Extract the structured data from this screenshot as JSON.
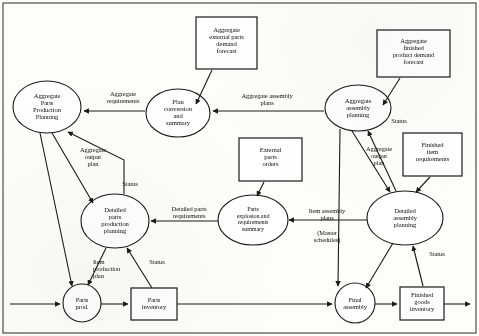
{
  "diagram": {
    "stroke_color": "#1a1a1a",
    "fill_color": "#ffffff",
    "background_color": "#fdfdfb",
    "nodes": [
      {
        "id": "agg_external_parts_forecast",
        "shape": "box",
        "label": "Aggregate\nexternal parts\ndemand\nforecast",
        "lines": [
          "Aggregate",
          "external parts",
          "demand",
          "forecast"
        ],
        "x": 196,
        "y": 17,
        "w": 61,
        "h": 52
      },
      {
        "id": "agg_finished_product_forecast",
        "shape": "box",
        "label": "Aggregate\nfinished\nproduct demand\nforecast",
        "lines": [
          "Aggregate",
          "finished",
          "product demand",
          "forecast"
        ],
        "x": 377,
        "y": 30,
        "w": 73,
        "h": 47
      },
      {
        "id": "agg_parts_production_planning",
        "shape": "ellipse",
        "label": "Aggregate\nParts\nProduction\nPlanning",
        "lines": [
          "Aggregate",
          "Parts",
          "Production",
          "Planning"
        ],
        "cx": 47,
        "cy": 107,
        "rx": 34,
        "ry": 26
      },
      {
        "id": "plan_conversion_and_summary",
        "shape": "ellipse",
        "label": "Plan\nconversion\nand\nsummary",
        "lines": [
          "Plan",
          "conversion",
          "and",
          "summary"
        ],
        "cx": 178,
        "cy": 113,
        "rx": 32,
        "ry": 24
      },
      {
        "id": "agg_assembly_planning",
        "shape": "ellipse",
        "label": "Aggregate\nassembly\nplanning",
        "lines": [
          "Aggregate",
          "assembly",
          "planning"
        ],
        "cx": 358,
        "cy": 108,
        "rx": 33,
        "ry": 23
      },
      {
        "id": "external_parts_orders",
        "shape": "box",
        "label": "External\nparts\norders",
        "lines": [
          "External",
          "parts",
          "orders"
        ],
        "x": 239,
        "y": 138,
        "w": 63,
        "h": 43
      },
      {
        "id": "finished_item_requirements",
        "shape": "box",
        "label": "Finished\nitem\nrequirements",
        "lines": [
          "Finished",
          "item",
          "requirements"
        ],
        "x": 403,
        "y": 133,
        "w": 59,
        "h": 43
      },
      {
        "id": "detailed_parts_production_planning",
        "shape": "ellipse",
        "label": "Detailed\nparts\nproduction\nplanning",
        "lines": [
          "Detailed",
          "parts",
          "production",
          "planning"
        ],
        "cx": 115,
        "cy": 221,
        "rx": 34,
        "ry": 27
      },
      {
        "id": "parts_explosion_requirements_summary",
        "shape": "ellipse",
        "label": "Parts\nexplosion and\nrequirements\nsummary",
        "lines": [
          "Parts",
          "explosion and",
          "requirements",
          "summary"
        ],
        "cx": 253,
        "cy": 220,
        "rx": 35,
        "ry": 25
      },
      {
        "id": "detailed_assembly_planning",
        "shape": "ellipse",
        "label": "Detailed\nassembly\nplanning",
        "lines": [
          "Detailed",
          "assembly",
          "planning"
        ],
        "cx": 405,
        "cy": 218,
        "rx": 38,
        "ry": 27
      },
      {
        "id": "parts_prod",
        "shape": "circle",
        "label": "Parts\nprod.",
        "lines": [
          "Parts",
          "prod."
        ],
        "cx": 82,
        "cy": 303,
        "rx": 19,
        "ry": 19
      },
      {
        "id": "parts_inventory",
        "shape": "box",
        "label": "Parts\ninventory",
        "lines": [
          "Parts",
          "inventory"
        ],
        "x": 131,
        "y": 288,
        "w": 46,
        "h": 32
      },
      {
        "id": "final_assembly",
        "shape": "circle",
        "label": "Final\nassembly",
        "lines": [
          "Final",
          "assembly"
        ],
        "cx": 355,
        "cy": 303,
        "rx": 20,
        "ry": 20
      },
      {
        "id": "finished_goods_inventory",
        "shape": "box",
        "label": "Finished\ngoods\ninventory",
        "lines": [
          "Finished",
          "goods",
          "inventory"
        ],
        "x": 400,
        "y": 287,
        "w": 44,
        "h": 33
      }
    ],
    "edge_labels": [
      {
        "id": "aggregate_requirements",
        "lines": [
          "Aggregate",
          "requirements"
        ],
        "x": 90,
        "y": 90,
        "w": 66
      },
      {
        "id": "aggregate_assembly_plans",
        "lines": [
          "Aggregate assembly",
          "plans"
        ],
        "x": 222,
        "y": 92,
        "w": 90
      },
      {
        "id": "aggregate_output_plan_left",
        "lines": [
          "Aggregate",
          "output",
          "plan"
        ],
        "x": 69,
        "y": 146,
        "w": 48
      },
      {
        "id": "status_left_top",
        "lines": [
          "Status"
        ],
        "x": 113,
        "y": 180,
        "w": 34
      },
      {
        "id": "status_agg_assembly",
        "lines": [
          "Status"
        ],
        "x": 382,
        "y": 117,
        "w": 34
      },
      {
        "id": "aggregate_output_plan_right",
        "lines": [
          "Aggregate",
          "output",
          "plan"
        ],
        "x": 355,
        "y": 145,
        "w": 48
      },
      {
        "id": "detailed_parts_requirements",
        "lines": [
          "Detailed parts",
          "requirements"
        ],
        "x": 154,
        "y": 205,
        "w": 70
      },
      {
        "id": "item_assembly_plans",
        "lines": [
          "Item assembly",
          "plans"
        ],
        "x": 292,
        "y": 207,
        "w": 70
      },
      {
        "id": "master_schedules",
        "lines": [
          "(Master",
          "schedules)"
        ],
        "x": 292,
        "y": 228,
        "w": 62
      },
      {
        "id": "item_production_plan",
        "lines": [
          "Item",
          "production",
          "plan"
        ],
        "x": 93,
        "y": 258,
        "w": 48
      },
      {
        "id": "status_parts_inventory",
        "lines": [
          "Status"
        ],
        "x": 140,
        "y": 258,
        "w": 34
      },
      {
        "id": "status_detailed_assembly",
        "lines": [
          "Status"
        ],
        "x": 420,
        "y": 250,
        "w": 34
      }
    ],
    "edges": [
      {
        "from": "agg_external_parts_forecast",
        "to": "plan_conversion_and_summary",
        "arrow": true
      },
      {
        "from": "agg_finished_product_forecast",
        "to": "agg_assembly_planning",
        "arrow": true
      },
      {
        "from": "plan_conversion_and_summary",
        "to": "agg_parts_production_planning",
        "arrow": true,
        "label": "aggregate_requirements"
      },
      {
        "from": "agg_assembly_planning",
        "to": "plan_conversion_and_summary",
        "arrow": true,
        "label": "aggregate_assembly_plans"
      },
      {
        "from": "agg_parts_production_planning",
        "to": "detailed_parts_production_planning",
        "arrow": true,
        "label": "aggregate_output_plan_left"
      },
      {
        "from": "agg_parts_production_planning",
        "to": "parts_prod",
        "arrow": true
      },
      {
        "from": "detailed_parts_production_planning",
        "to": "agg_parts_production_planning",
        "arrow": true,
        "label": "status_left_top"
      },
      {
        "from": "agg_assembly_planning",
        "to": "detailed_assembly_planning",
        "arrow": true,
        "label": "aggregate_output_plan_right"
      },
      {
        "from": "agg_assembly_planning",
        "to": "final_assembly",
        "arrow": true
      },
      {
        "from": "detailed_assembly_planning",
        "to": "agg_assembly_planning",
        "arrow": true,
        "label": "status_agg_assembly"
      },
      {
        "from": "external_parts_orders",
        "to": "parts_explosion_requirements_summary",
        "arrow": true
      },
      {
        "from": "finished_item_requirements",
        "to": "detailed_assembly_planning",
        "arrow": true
      },
      {
        "from": "parts_explosion_requirements_summary",
        "to": "detailed_parts_production_planning",
        "arrow": true,
        "label": "detailed_parts_requirements"
      },
      {
        "from": "detailed_assembly_planning",
        "to": "parts_explosion_requirements_summary",
        "arrow": true,
        "label": "item_assembly_plans"
      },
      {
        "from": "detailed_parts_production_planning",
        "to": "parts_prod",
        "arrow": true,
        "label": "item_production_plan"
      },
      {
        "from": "parts_inventory",
        "to": "detailed_parts_production_planning",
        "arrow": true,
        "label": "status_parts_inventory"
      },
      {
        "from": "detailed_assembly_planning",
        "to": "final_assembly",
        "arrow": true
      },
      {
        "from": "finished_goods_inventory",
        "to": "detailed_assembly_planning",
        "arrow": true,
        "label": "status_detailed_assembly"
      },
      {
        "from": "parts_prod",
        "to": "parts_inventory",
        "arrow": true
      },
      {
        "from": "parts_inventory",
        "to": "final_assembly",
        "arrow": true
      },
      {
        "from": "final_assembly",
        "to": "finished_goods_inventory",
        "arrow": true
      },
      {
        "from": "external_input",
        "to": "parts_prod",
        "arrow": true
      },
      {
        "from": "finished_goods_inventory",
        "to": "external_output",
        "arrow": true
      }
    ]
  }
}
